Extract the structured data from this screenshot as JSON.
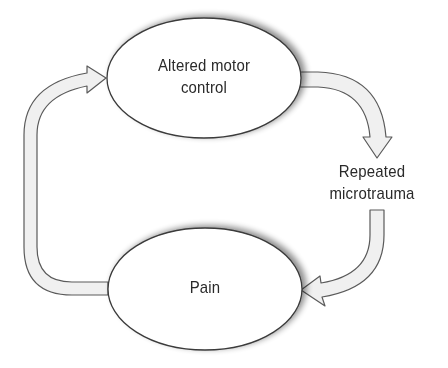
{
  "diagram": {
    "type": "cycle",
    "nodes": [
      {
        "id": "altered-motor-control",
        "line1": "Altered motor",
        "line2": "control"
      },
      {
        "id": "repeated-microtrauma",
        "line1": "Repeated",
        "line2": "microtrauma"
      },
      {
        "id": "pain",
        "line1": "Pain"
      }
    ],
    "edges": [
      {
        "from": "altered-motor-control",
        "to": "repeated-microtrauma"
      },
      {
        "from": "repeated-microtrauma",
        "to": "pain"
      },
      {
        "from": "pain",
        "to": "altered-motor-control"
      }
    ],
    "colors": {
      "stroke": "#4a4a4a",
      "arrow_fill": "#f0f0f0",
      "ellipse_fill": "#ffffff",
      "text": "#2a2a2a"
    }
  }
}
